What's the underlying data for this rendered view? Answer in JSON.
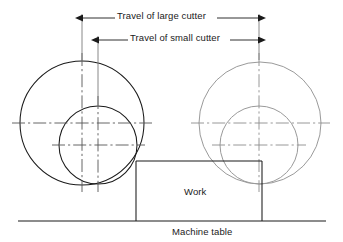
{
  "figure": {
    "type": "engineering-diagram"
  },
  "dimensions": {
    "large_cutter": {
      "label": "Travel of large cutter",
      "left_x": 82,
      "right_x": 259,
      "y": 18
    },
    "small_cutter": {
      "label": "Travel of small cutter",
      "left_x": 98,
      "right_x": 259,
      "y": 40
    }
  },
  "labels": {
    "work": "Work",
    "machine_table": "Machine table"
  },
  "geometry": {
    "left_large_cutter": {
      "cx": 82,
      "cy": 123,
      "r": 62,
      "stroke": "#1a1a1a"
    },
    "left_small_cutter": {
      "cx": 98,
      "cy": 145,
      "r": 39,
      "stroke": "#1a1a1a"
    },
    "right_large_cutter": {
      "cx": 260,
      "cy": 123,
      "r": 61,
      "stroke": "#9a9a9a"
    },
    "right_small_cutter": {
      "cx": 259,
      "cy": 145,
      "r": 39,
      "stroke": "#9a9a9a"
    },
    "work_block": {
      "x": 136,
      "y": 161,
      "w": 126,
      "h": 60
    },
    "machine_table_line": {
      "x1": 18,
      "x2": 326,
      "y": 221
    }
  },
  "colors": {
    "ink": "#1a1a1a",
    "ghost": "#9a9a9a",
    "centerline": "#555555",
    "background": "#ffffff"
  }
}
